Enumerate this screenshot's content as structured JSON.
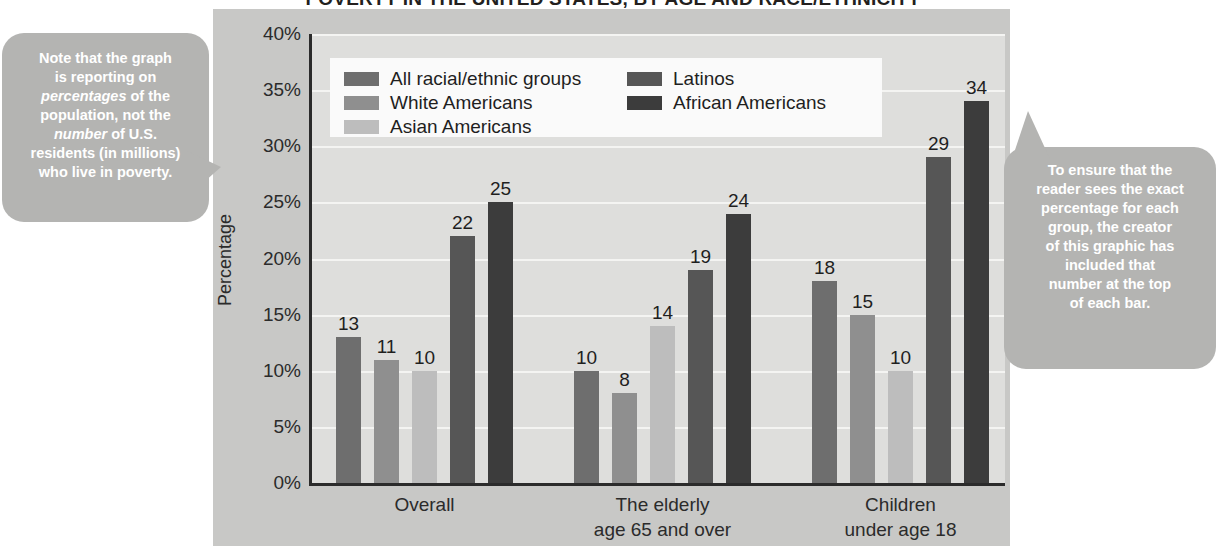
{
  "chart_data": {
    "type": "bar",
    "title": "POVERTY IN THE UNITED STATES, BY AGE AND RACE/ETHNICITY",
    "xlabel": "",
    "ylabel": "Percentage",
    "ylim": [
      0,
      40
    ],
    "ytick_labels": [
      "40%",
      "35%",
      "30%",
      "25%",
      "20%",
      "15%",
      "10%",
      "5%",
      "0%"
    ],
    "ytick_values": [
      40,
      35,
      30,
      25,
      20,
      15,
      10,
      5,
      0
    ],
    "grid": true,
    "legend_position": "inside-top-left",
    "categories": [
      "Overall",
      "The elderly age 65 and over",
      "Children under age 18"
    ],
    "category_labels": [
      [
        "Overall"
      ],
      [
        "The elderly",
        "age 65 and over"
      ],
      [
        "Children",
        "under age 18"
      ]
    ],
    "series": [
      {
        "name": "All racial/ethnic groups",
        "color": "#6e6e6e",
        "values": [
          13,
          10,
          18
        ]
      },
      {
        "name": "White Americans",
        "color": "#8f8f8f",
        "values": [
          11,
          8,
          15
        ]
      },
      {
        "name": "Asian Americans",
        "color": "#bdbdbd",
        "values": [
          10,
          14,
          10
        ]
      },
      {
        "name": "Latinos",
        "color": "#565656",
        "values": [
          22,
          19,
          29
        ]
      },
      {
        "name": "African Americans",
        "color": "#3c3c3c",
        "values": [
          25,
          24,
          34
        ]
      }
    ]
  },
  "callouts": {
    "left": {
      "lines": [
        {
          "text": "Note that the graph",
          "italic": false
        },
        {
          "text": "is reporting on",
          "italic": false
        },
        {
          "text": "percentages",
          "italic": true,
          "suffix": " of the"
        },
        {
          "text": "population, not the",
          "italic": false
        },
        {
          "text": "number",
          "italic": true,
          "suffix": " of U.S."
        },
        {
          "text": "residents (in millions)",
          "italic": false
        },
        {
          "text": "who live in poverty.",
          "italic": false
        }
      ],
      "full_text": "Note that the graph is reporting on percentages of the population, not the number of U.S. residents (in millions) who live in poverty."
    },
    "right": {
      "lines": [
        "To ensure that the",
        "reader sees the exact",
        "percentage for each",
        "group, the creator",
        "of this graphic has",
        "included that",
        "number at the top",
        "of each bar."
      ],
      "full_text": "To ensure that the reader sees the exact percentage for each group, the creator of this graphic has included that number at the top of each bar."
    }
  },
  "colors": {
    "panel": "#c8c8c6",
    "plot_bg": "#dededc",
    "gridline": "#f4f4f2",
    "axis": "#2b2b2b",
    "callout_bg": "#b4b4b2",
    "callout_text": "#ffffff",
    "legend_bg": "#fafafa"
  }
}
